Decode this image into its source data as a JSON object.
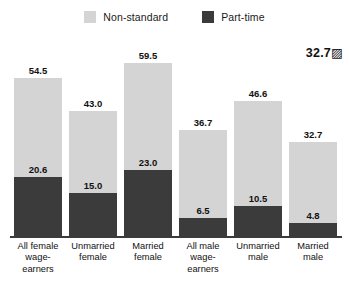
{
  "legend": {
    "items": [
      {
        "label": "Non-standard",
        "color": "#d4d4d4",
        "icon": "legend-swatch-square"
      },
      {
        "label": "Part-time",
        "color": "#3b3b3b",
        "icon": "legend-swatch-square"
      }
    ]
  },
  "annotation": {
    "text": "32.7▨"
  },
  "chart_data": {
    "type": "bar",
    "title": "",
    "subtitle": "",
    "xlabel": "",
    "ylabel": "",
    "ylim": [
      0,
      62
    ],
    "grid": false,
    "legend_position": "top-center",
    "overlay": true,
    "categories": [
      "All female wage-earners",
      "Unmarried female",
      "Married female",
      "All male wage-earners",
      "Unmarried male",
      "Married male"
    ],
    "category_lines": [
      [
        "All female",
        "wage-",
        "earners"
      ],
      [
        "Unmarried",
        "female"
      ],
      [
        "Married",
        "female"
      ],
      [
        "All male",
        "wage-",
        "earners"
      ],
      [
        "Unmarried",
        "male"
      ],
      [
        "Married",
        "male"
      ]
    ],
    "series": [
      {
        "name": "Non-standard",
        "color": "#d4d4d4",
        "values": [
          54.5,
          43.0,
          59.5,
          36.7,
          46.6,
          32.7
        ],
        "labels": [
          "54.5",
          "43.0",
          "59.5",
          "36.7",
          "46.6",
          "32.7"
        ]
      },
      {
        "name": "Part-time",
        "color": "#3b3b3b",
        "values": [
          20.6,
          15.0,
          23.0,
          6.5,
          10.5,
          4.8
        ],
        "labels": [
          "20.6",
          "15.0",
          "23.0",
          "6.5",
          "10.5",
          "4.8"
        ]
      }
    ]
  },
  "geometry": {
    "plot_left": 14,
    "bar_width": 48,
    "bar_gap": 7,
    "baseline_y": 236,
    "value_scale_px_per_unit": 2.92
  }
}
